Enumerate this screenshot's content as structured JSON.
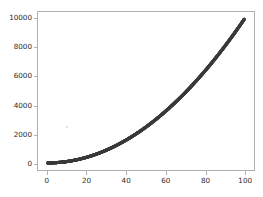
{
  "chart_data": {
    "type": "scatter",
    "title": "",
    "xlabel": "",
    "ylabel": "",
    "xlim": [
      -4.95,
      104.95
    ],
    "ylim": [
      -495,
      10495
    ],
    "xticks": [
      0,
      20,
      40,
      60,
      80,
      100
    ],
    "yticks": [
      0,
      2000,
      4000,
      6000,
      8000,
      10000
    ],
    "xtick_labels": [
      "0",
      "20",
      "40",
      "60",
      "80",
      "100"
    ],
    "ytick_labels": [
      "0",
      "2000",
      "4000",
      "6000",
      "8000",
      "10000"
    ],
    "grid": false,
    "legend": null,
    "marker_color": "#3c3c3c",
    "marker_size": 3.2,
    "spine_color": "#b0b0b0",
    "background_color": "#ffffff",
    "series": [
      {
        "name": "y = x^2",
        "x": [
          0,
          1,
          2,
          3,
          4,
          5,
          6,
          7,
          8,
          9,
          10,
          11,
          12,
          13,
          14,
          15,
          16,
          17,
          18,
          19,
          20,
          21,
          22,
          23,
          24,
          25,
          26,
          27,
          28,
          29,
          30,
          31,
          32,
          33,
          34,
          35,
          36,
          37,
          38,
          39,
          40,
          41,
          42,
          43,
          44,
          45,
          46,
          47,
          48,
          49,
          50,
          51,
          52,
          53,
          54,
          55,
          56,
          57,
          58,
          59,
          60,
          61,
          62,
          63,
          64,
          65,
          66,
          67,
          68,
          69,
          70,
          71,
          72,
          73,
          74,
          75,
          76,
          77,
          78,
          79,
          80,
          81,
          82,
          83,
          84,
          85,
          86,
          87,
          88,
          89,
          90,
          91,
          92,
          93,
          94,
          95,
          96,
          97,
          98,
          99,
          100
        ],
        "y": [
          0,
          1,
          4,
          9,
          16,
          25,
          36,
          49,
          64,
          81,
          100,
          121,
          144,
          169,
          196,
          225,
          256,
          289,
          324,
          361,
          400,
          441,
          484,
          529,
          576,
          625,
          676,
          729,
          784,
          841,
          900,
          961,
          1024,
          1089,
          1156,
          1225,
          1296,
          1369,
          1444,
          1521,
          1600,
          1681,
          1764,
          1849,
          1936,
          2025,
          2116,
          2209,
          2304,
          2401,
          2500,
          2601,
          2704,
          2809,
          2916,
          3025,
          3136,
          3249,
          3364,
          3481,
          3600,
          3721,
          3844,
          3969,
          4096,
          4225,
          4356,
          4489,
          4624,
          4761,
          4900,
          5041,
          5184,
          5329,
          5476,
          5625,
          5776,
          5929,
          6084,
          6241,
          6400,
          6561,
          6724,
          6889,
          7056,
          7225,
          7396,
          7569,
          7744,
          7921,
          8100,
          8281,
          8464,
          8649,
          8836,
          9025,
          9216,
          9409,
          9604,
          9801,
          10000
        ]
      }
    ]
  }
}
